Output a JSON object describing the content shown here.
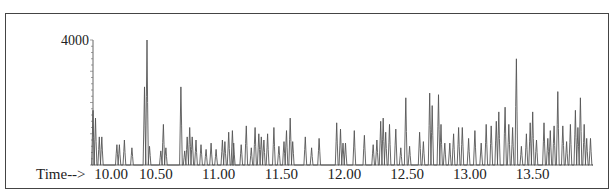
{
  "chart_data": {
    "type": "line",
    "title": "",
    "xlabel": "Time-->",
    "ylabel": "",
    "x_tick_labels": [
      "10.00",
      "10.50",
      "11.00",
      "11.50",
      "12.00",
      "12.50",
      "13.00",
      "13.50"
    ],
    "x_ticks": [
      10.0,
      10.5,
      11.0,
      11.5,
      12.0,
      12.5,
      13.0,
      13.5
    ],
    "y_tick_labels": [
      "4000"
    ],
    "y_ticks": [
      4000
    ],
    "xlim": [
      10.0,
      13.98
    ],
    "ylim": [
      0,
      4000
    ],
    "grid": false,
    "legend": null,
    "series": [
      {
        "name": "TIC",
        "peaks": [
          [
            10.0,
            1750
          ],
          [
            10.02,
            1500
          ],
          [
            10.05,
            900
          ],
          [
            10.07,
            900
          ],
          [
            10.19,
            650
          ],
          [
            10.21,
            650
          ],
          [
            10.25,
            800
          ],
          [
            10.31,
            550
          ],
          [
            10.41,
            2500
          ],
          [
            10.43,
            4000
          ],
          [
            10.45,
            600
          ],
          [
            10.54,
            450
          ],
          [
            10.56,
            1300
          ],
          [
            10.58,
            550
          ],
          [
            10.7,
            2500
          ],
          [
            10.73,
            450
          ],
          [
            10.75,
            900
          ],
          [
            10.77,
            1200
          ],
          [
            10.79,
            900
          ],
          [
            10.82,
            800
          ],
          [
            10.86,
            650
          ],
          [
            10.9,
            500
          ],
          [
            10.94,
            700
          ],
          [
            10.98,
            500
          ],
          [
            11.03,
            800
          ],
          [
            11.05,
            750
          ],
          [
            11.08,
            1050
          ],
          [
            11.11,
            1100
          ],
          [
            11.12,
            700
          ],
          [
            11.18,
            650
          ],
          [
            11.22,
            1250
          ],
          [
            11.26,
            550
          ],
          [
            11.29,
            1200
          ],
          [
            11.32,
            1000
          ],
          [
            11.34,
            900
          ],
          [
            11.36,
            800
          ],
          [
            11.39,
            1000
          ],
          [
            11.44,
            1200
          ],
          [
            11.48,
            600
          ],
          [
            11.52,
            750
          ],
          [
            11.54,
            1100
          ],
          [
            11.57,
            1500
          ],
          [
            11.59,
            750
          ],
          [
            11.69,
            900
          ],
          [
            11.74,
            550
          ],
          [
            11.8,
            850
          ],
          [
            11.94,
            1350
          ],
          [
            11.97,
            1150
          ],
          [
            11.99,
            700
          ],
          [
            12.01,
            700
          ],
          [
            12.08,
            1100
          ],
          [
            12.16,
            950
          ],
          [
            12.23,
            650
          ],
          [
            12.26,
            800
          ],
          [
            12.29,
            1400
          ],
          [
            12.31,
            1500
          ],
          [
            12.33,
            1050
          ],
          [
            12.36,
            1300
          ],
          [
            12.41,
            1150
          ],
          [
            12.45,
            550
          ],
          [
            12.49,
            2150
          ],
          [
            12.52,
            600
          ],
          [
            12.6,
            1050
          ],
          [
            12.63,
            750
          ],
          [
            12.68,
            2300
          ],
          [
            12.7,
            1900
          ],
          [
            12.75,
            2250
          ],
          [
            12.77,
            1300
          ],
          [
            12.8,
            700
          ],
          [
            12.84,
            700
          ],
          [
            12.87,
            1000
          ],
          [
            12.91,
            1200
          ],
          [
            12.94,
            1200
          ],
          [
            12.99,
            850
          ],
          [
            13.04,
            1100
          ],
          [
            13.09,
            700
          ],
          [
            13.13,
            1300
          ],
          [
            13.17,
            1250
          ],
          [
            13.21,
            1400
          ],
          [
            13.23,
            1700
          ],
          [
            13.28,
            1850
          ],
          [
            13.31,
            1300
          ],
          [
            13.34,
            1200
          ],
          [
            13.37,
            3400
          ],
          [
            13.41,
            600
          ],
          [
            13.45,
            1000
          ],
          [
            13.48,
            1350
          ],
          [
            13.5,
            1700
          ],
          [
            13.53,
            800
          ],
          [
            13.59,
            1350
          ],
          [
            13.62,
            850
          ],
          [
            13.64,
            1100
          ],
          [
            13.67,
            1250
          ],
          [
            13.7,
            2350
          ],
          [
            13.74,
            1250
          ],
          [
            13.77,
            750
          ],
          [
            13.8,
            1300
          ],
          [
            13.84,
            1750
          ],
          [
            13.86,
            1200
          ],
          [
            13.88,
            2150
          ],
          [
            13.91,
            1300
          ],
          [
            13.93,
            850
          ],
          [
            13.96,
            850
          ]
        ]
      }
    ]
  }
}
